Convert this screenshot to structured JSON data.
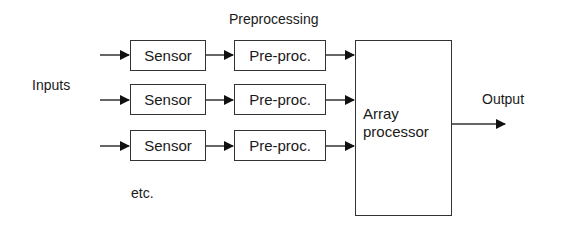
{
  "title": "Preprocessing",
  "inputs_label": "Inputs",
  "output_label": "Output",
  "etc_label": "etc.",
  "rows": [
    {
      "sensor": "Sensor",
      "preproc": "Pre-proc."
    },
    {
      "sensor": "Sensor",
      "preproc": "Pre-proc."
    },
    {
      "sensor": "Sensor",
      "preproc": "Pre-proc."
    }
  ],
  "array_processor": {
    "line1": "Array",
    "line2": "processor"
  }
}
